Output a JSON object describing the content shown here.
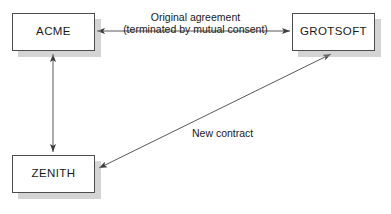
{
  "diagram": {
    "background_color": "#ffffff",
    "line_color": "#595959",
    "box_border_color": "#4d4d4d",
    "box_fill_color": "#ffffff",
    "shadow_color": "#a0a0a0",
    "text_color": "#1a1a1a",
    "nodes": [
      {
        "id": "acme",
        "label": "ACME",
        "x": 12,
        "y": 13,
        "width": 83,
        "height": 38
      },
      {
        "id": "grotsoft",
        "label": "GROTSOFT",
        "x": 292,
        "y": 13,
        "width": 83,
        "height": 38
      },
      {
        "id": "zenith",
        "label": "ZENITH",
        "x": 12,
        "y": 155,
        "width": 83,
        "height": 38
      }
    ],
    "edges": [
      {
        "id": "acme-grotsoft",
        "from": "acme",
        "to": "grotsoft",
        "direction": "bidirectional",
        "label_line_1": "Original agreement",
        "label_line_2": "(terminated by mutual consent)"
      },
      {
        "id": "acme-zenith",
        "from": "acme",
        "to": "zenith",
        "direction": "bidirectional",
        "label_line_1": "",
        "label_line_2": ""
      },
      {
        "id": "zenith-grotsoft",
        "from": "zenith",
        "to": "grotsoft",
        "direction": "bidirectional",
        "label_line_1": "New contract",
        "label_line_2": ""
      }
    ],
    "bottom_artifact_text": ""
  }
}
